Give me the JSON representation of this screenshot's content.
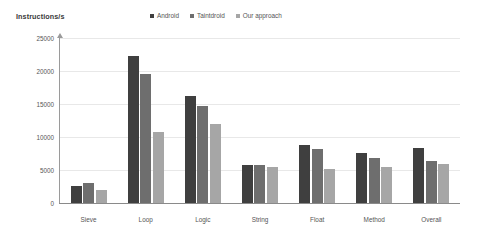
{
  "chart_data": {
    "type": "bar",
    "title": "Instructions/s",
    "xlabel": "",
    "ylabel": "",
    "categories": [
      "Sieve",
      "Loop",
      "Logic",
      "String",
      "Float",
      "Method",
      "Overall"
    ],
    "series": [
      {
        "name": "Android",
        "color": "#3f3f3f",
        "values": [
          2600,
          22200,
          16200,
          5700,
          8800,
          7600,
          8300
        ]
      },
      {
        "name": "Taintdroid",
        "color": "#6e6e6e",
        "values": [
          3100,
          19600,
          14700,
          5700,
          8200,
          6800,
          6300
        ]
      },
      {
        "name": "Our approach",
        "color": "#a6a6a6",
        "values": [
          2000,
          10700,
          11900,
          5500,
          5200,
          5500,
          5900
        ]
      }
    ],
    "ylim": [
      0,
      25000
    ],
    "yticks": [
      0,
      5000,
      10000,
      15000,
      20000,
      25000
    ],
    "ytick_labels": [
      "0",
      "5000",
      "10000",
      "15000",
      "20000",
      "25000"
    ],
    "grid": true,
    "legend_position": "top-center",
    "axis_color": "#8a8a8a",
    "grid_color": "#e8e8e8",
    "background": "#ffffff"
  }
}
